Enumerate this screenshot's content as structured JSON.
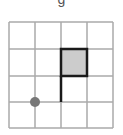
{
  "figure": {
    "top_label": "g",
    "grid": {
      "cols": 4,
      "rows": 4,
      "x_lines": [
        9,
        35,
        61,
        87,
        113
      ],
      "y_lines": [
        22,
        49,
        76,
        102,
        128
      ],
      "line_color": "#aaaaaa"
    },
    "shaded_square": {
      "x": 61,
      "y": 49,
      "w": 26,
      "h": 27,
      "fill": "#cccccc",
      "stroke": "#1a1a1a"
    },
    "flag_pole": {
      "x": 61,
      "y1": 76,
      "y2": 102,
      "stroke": "#1a1a1a"
    },
    "dot": {
      "cx": 35,
      "cy": 102,
      "r": 5,
      "fill": "#777777"
    }
  }
}
